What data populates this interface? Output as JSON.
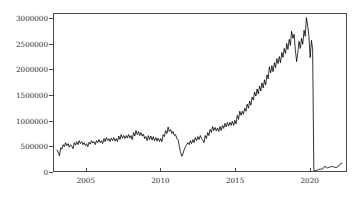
{
  "chart_data": {
    "type": "line",
    "title": "",
    "subtitle": "",
    "xlabel": "",
    "ylabel": "",
    "xlim": [
      2002.8,
      2022.5
    ],
    "ylim": [
      0,
      3100000
    ],
    "grid": false,
    "legend": "none",
    "line_color": "#000000",
    "axis_color": "#4a4a4a",
    "background_color": "#ffffff",
    "xticks": [
      2005,
      2010,
      2015,
      2020
    ],
    "xtick_labels": [
      "2005",
      "2010",
      "2015",
      "2020"
    ],
    "yticks": [
      0,
      500000,
      1000000,
      1500000,
      2000000,
      2500000,
      3000000
    ],
    "ytick_labels": [
      "0",
      "500000",
      "1000000",
      "1500000",
      "2000000",
      "2500000",
      "3000000"
    ],
    "series": [
      {
        "name": "monthly series",
        "x": [
          2003.0,
          2003.08,
          2003.17,
          2003.25,
          2003.33,
          2003.42,
          2003.5,
          2003.58,
          2003.67,
          2003.75,
          2003.83,
          2003.92,
          2004.0,
          2004.08,
          2004.17,
          2004.25,
          2004.33,
          2004.42,
          2004.5,
          2004.58,
          2004.67,
          2004.75,
          2004.83,
          2004.92,
          2005.0,
          2005.08,
          2005.17,
          2005.25,
          2005.33,
          2005.42,
          2005.5,
          2005.58,
          2005.67,
          2005.75,
          2005.83,
          2005.92,
          2006.0,
          2006.08,
          2006.17,
          2006.25,
          2006.33,
          2006.42,
          2006.5,
          2006.58,
          2006.67,
          2006.75,
          2006.83,
          2006.92,
          2007.0,
          2007.08,
          2007.17,
          2007.25,
          2007.33,
          2007.42,
          2007.5,
          2007.58,
          2007.67,
          2007.75,
          2007.83,
          2007.92,
          2008.0,
          2008.08,
          2008.17,
          2008.25,
          2008.33,
          2008.42,
          2008.5,
          2008.58,
          2008.67,
          2008.75,
          2008.83,
          2008.92,
          2009.0,
          2009.08,
          2009.17,
          2009.25,
          2009.33,
          2009.42,
          2009.5,
          2009.58,
          2009.67,
          2009.75,
          2009.83,
          2009.92,
          2010.0,
          2010.08,
          2010.17,
          2010.25,
          2010.33,
          2010.42,
          2010.5,
          2010.58,
          2010.67,
          2010.75,
          2010.83,
          2010.92,
          2011.0,
          2011.08,
          2011.17,
          2011.25,
          2011.33,
          2011.42,
          2011.5,
          2011.58,
          2011.67,
          2011.75,
          2011.83,
          2011.92,
          2012.0,
          2012.08,
          2012.17,
          2012.25,
          2012.33,
          2012.42,
          2012.5,
          2012.58,
          2012.67,
          2012.75,
          2012.83,
          2012.92,
          2013.0,
          2013.08,
          2013.17,
          2013.25,
          2013.33,
          2013.42,
          2013.5,
          2013.58,
          2013.67,
          2013.75,
          2013.83,
          2013.92,
          2014.0,
          2014.08,
          2014.17,
          2014.25,
          2014.33,
          2014.42,
          2014.5,
          2014.58,
          2014.67,
          2014.75,
          2014.83,
          2014.92,
          2015.0,
          2015.08,
          2015.17,
          2015.25,
          2015.33,
          2015.42,
          2015.5,
          2015.58,
          2015.67,
          2015.75,
          2015.83,
          2015.92,
          2016.0,
          2016.08,
          2016.17,
          2016.25,
          2016.33,
          2016.42,
          2016.5,
          2016.58,
          2016.67,
          2016.75,
          2016.83,
          2016.92,
          2017.0,
          2017.08,
          2017.17,
          2017.25,
          2017.33,
          2017.42,
          2017.5,
          2017.58,
          2017.67,
          2017.75,
          2017.83,
          2017.92,
          2018.0,
          2018.08,
          2018.17,
          2018.25,
          2018.33,
          2018.42,
          2018.5,
          2018.58,
          2018.67,
          2018.75,
          2018.83,
          2018.92,
          2019.0,
          2019.08,
          2019.17,
          2019.25,
          2019.33,
          2019.42,
          2019.5,
          2019.58,
          2019.67,
          2019.75,
          2019.83,
          2019.92,
          2020.0,
          2020.08,
          2020.17,
          2020.25,
          2020.33,
          2020.42,
          2020.5,
          2020.58,
          2020.67,
          2020.75,
          2020.83,
          2020.92,
          2021.0,
          2021.08,
          2021.17,
          2021.25,
          2021.33,
          2021.42,
          2021.5,
          2021.58,
          2021.67,
          2021.75,
          2021.83,
          2021.92,
          2022.0,
          2022.08,
          2022.17,
          2022.25
        ],
        "values": [
          420000,
          370000,
          300000,
          460000,
          430000,
          520000,
          480000,
          560000,
          500000,
          540000,
          470000,
          520000,
          490000,
          440000,
          560000,
          510000,
          580000,
          520000,
          600000,
          540000,
          580000,
          520000,
          560000,
          500000,
          540000,
          480000,
          570000,
          530000,
          600000,
          550000,
          580000,
          520000,
          600000,
          560000,
          620000,
          560000,
          600000,
          540000,
          640000,
          580000,
          660000,
          600000,
          640000,
          580000,
          650000,
          600000,
          660000,
          590000,
          640000,
          580000,
          690000,
          620000,
          720000,
          650000,
          700000,
          640000,
          700000,
          650000,
          720000,
          650000,
          700000,
          620000,
          760000,
          690000,
          800000,
          720000,
          780000,
          700000,
          760000,
          690000,
          730000,
          640000,
          680000,
          600000,
          700000,
          620000,
          690000,
          610000,
          680000,
          600000,
          660000,
          590000,
          650000,
          580000,
          640000,
          580000,
          720000,
          680000,
          800000,
          740000,
          870000,
          780000,
          820000,
          740000,
          780000,
          700000,
          720000,
          640000,
          620000,
          500000,
          380000,
          290000,
          340000,
          420000,
          480000,
          520000,
          560000,
          520000,
          600000,
          540000,
          620000,
          560000,
          660000,
          600000,
          680000,
          620000,
          700000,
          640000,
          620000,
          560000,
          700000,
          640000,
          760000,
          700000,
          820000,
          760000,
          880000,
          800000,
          860000,
          790000,
          850000,
          780000,
          880000,
          800000,
          900000,
          840000,
          940000,
          870000,
          960000,
          890000,
          960000,
          900000,
          980000,
          900000,
          1000000,
          930000,
          1100000,
          1020000,
          1180000,
          1100000,
          1180000,
          1120000,
          1240000,
          1180000,
          1320000,
          1240000,
          1380000,
          1300000,
          1460000,
          1400000,
          1560000,
          1480000,
          1620000,
          1520000,
          1680000,
          1580000,
          1740000,
          1640000,
          1800000,
          1700000,
          1900000,
          1820000,
          2060000,
          1940000,
          2080000,
          1960000,
          2140000,
          2040000,
          2220000,
          2120000,
          2260000,
          2140000,
          2340000,
          2240000,
          2420000,
          2320000,
          2520000,
          2400000,
          2600000,
          2480000,
          2760000,
          2620000,
          2700000,
          2400000,
          2160000,
          2340000,
          2560000,
          2420000,
          2620000,
          2500000,
          2780000,
          2660000,
          3030000,
          2860000,
          2660000,
          2240000,
          2580000,
          2400000,
          10000,
          8000,
          12000,
          20000,
          30000,
          40000,
          35000,
          45000,
          60000,
          95000,
          75000,
          60000,
          70000,
          80000,
          90000,
          85000,
          80000,
          75000,
          70000,
          80000,
          95000,
          130000,
          150000,
          148000
        ]
      }
    ]
  }
}
